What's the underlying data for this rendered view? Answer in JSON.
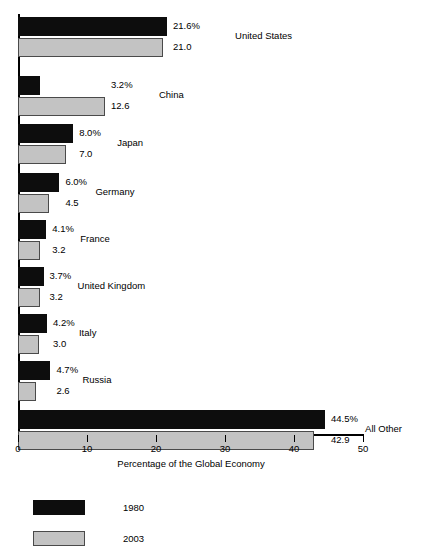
{
  "chart_data": {
    "type": "bar",
    "orientation": "horizontal",
    "title": "",
    "xlabel": "Percentage of the Global Economy",
    "ylabel": "",
    "xlim": [
      0,
      50
    ],
    "xticks": [
      0,
      10,
      20,
      30,
      40,
      50
    ],
    "xtick_labels": [
      "0",
      "10",
      "20",
      "30",
      "40",
      "50"
    ],
    "grid": false,
    "legend_position": "bottom-left",
    "categories": [
      "United States",
      "China",
      "Japan",
      "Germany",
      "France",
      "United Kingdom",
      "Italy",
      "Russia",
      "All Other"
    ],
    "series": [
      {
        "name": "1980",
        "color": "#0d0d0d",
        "values": [
          21.6,
          3.2,
          8.0,
          6.0,
          4.1,
          3.7,
          4.2,
          4.7,
          44.5
        ],
        "labels": [
          "21.6%",
          "3.2%",
          "8.0%",
          "6.0%",
          "4.1%",
          "3.7%",
          "4.2%",
          "4.7%",
          "44.5%"
        ]
      },
      {
        "name": "2003",
        "color": "#c3c3c3",
        "values": [
          21.0,
          12.6,
          7.0,
          4.5,
          3.2,
          3.2,
          3.0,
          2.6,
          42.9
        ],
        "labels": [
          "21.0",
          "12.6",
          "7.0",
          "4.5",
          "3.2",
          "3.2",
          "3.0",
          "2.6",
          "42.9"
        ]
      }
    ]
  },
  "legend": {
    "items": [
      {
        "label": "1980",
        "color": "#0d0d0d"
      },
      {
        "label": "2003",
        "color": "#c3c3c3"
      }
    ]
  }
}
